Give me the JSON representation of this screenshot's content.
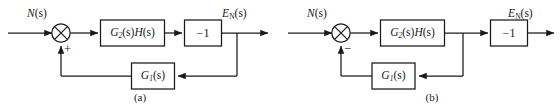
{
  "figure": {
    "background_color": "#ffffff",
    "line_color": "#1a1a1a",
    "type": "control-system-block-diagram-pair"
  },
  "diagrams": [
    {
      "id": "a",
      "caption": "(a)",
      "input_label_main": "N",
      "input_label_arg": "(s)",
      "output_label_main": "E",
      "output_label_sub": "N",
      "output_label_arg": "(s)",
      "summing_junction": {
        "symbol": "x-cross",
        "feedback_sign": "+"
      },
      "forward_block_1": {
        "g_letter": "G",
        "g_sub": "2",
        "g_arg": "(s)",
        "h_letter": "H",
        "h_arg": "(s)"
      },
      "forward_block_2": {
        "label": "−1"
      },
      "feedback_block": {
        "g_letter": "G",
        "g_sub": "1",
        "g_arg": "(s)"
      },
      "feedback_tap": "after-minus-one-block"
    },
    {
      "id": "b",
      "caption": "(b)",
      "input_label_main": "N",
      "input_label_arg": "(s)",
      "output_label_main": "E",
      "output_label_sub": "N",
      "output_label_arg": "(s)",
      "summing_junction": {
        "symbol": "x-cross",
        "feedback_sign": "−"
      },
      "forward_block_1": {
        "g_letter": "G",
        "g_sub": "2",
        "g_arg": "(s)",
        "h_letter": "H",
        "h_arg": "(s)"
      },
      "forward_block_2": {
        "label": "−1"
      },
      "feedback_block": {
        "g_letter": "G",
        "g_sub": "1",
        "g_arg": "(s)"
      },
      "feedback_tap": "before-minus-one-block"
    }
  ]
}
